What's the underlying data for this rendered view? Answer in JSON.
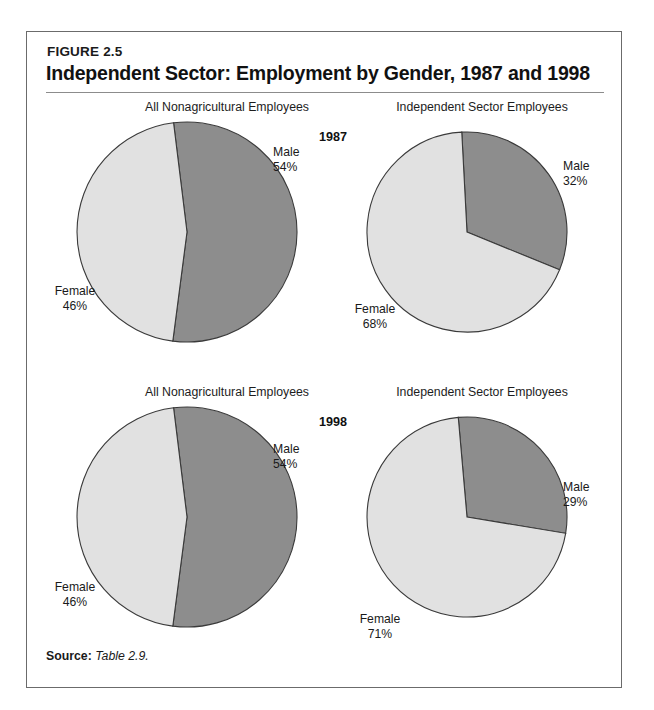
{
  "figure": {
    "number_label": "FIGURE 2.5",
    "title": "Independent Sector: Employment by Gender, 1987 and 1998",
    "source_key": "Source:",
    "source_value": "Table 2.9."
  },
  "column_headers": {
    "left": "All Nonagricultural Employees",
    "right": "Independent Sector Employees"
  },
  "year_labels": {
    "row1": "1987",
    "row2": "1998"
  },
  "labels": {
    "male": "Male",
    "female": "Female",
    "p54": "54%",
    "p46": "46%",
    "p32": "32%",
    "p68": "68%",
    "p29": "29%",
    "p71": "71%"
  },
  "colors": {
    "male_slice": "#8d8d8d",
    "female_slice": "#e1e1e1",
    "slice_outline": "#3a3a3a",
    "frame": "#6b6b6b",
    "text": "#1a1a1a"
  },
  "chart_data": [
    {
      "type": "pie",
      "title": "All Nonagricultural Employees",
      "year": "1987",
      "categories": [
        "Male",
        "Female"
      ],
      "values": [
        54,
        46
      ],
      "labels": [
        "54%",
        "46%"
      ],
      "colors": [
        "#8d8d8d",
        "#e1e1e1"
      ],
      "legend": "none",
      "start_angle_deg": -7,
      "direction": "clockwise"
    },
    {
      "type": "pie",
      "title": "Independent Sector Employees",
      "year": "1987",
      "categories": [
        "Male",
        "Female"
      ],
      "values": [
        32,
        68
      ],
      "labels": [
        "32%",
        "68%"
      ],
      "colors": [
        "#8d8d8d",
        "#e1e1e1"
      ],
      "legend": "none",
      "start_angle_deg": -3,
      "direction": "clockwise"
    },
    {
      "type": "pie",
      "title": "All Nonagricultural Employees",
      "year": "1998",
      "categories": [
        "Male",
        "Female"
      ],
      "values": [
        54,
        46
      ],
      "labels": [
        "54%",
        "46%"
      ],
      "colors": [
        "#8d8d8d",
        "#e1e1e1"
      ],
      "legend": "none",
      "start_angle_deg": -7,
      "direction": "clockwise"
    },
    {
      "type": "pie",
      "title": "Independent Sector Employees",
      "year": "1998",
      "categories": [
        "Male",
        "Female"
      ],
      "values": [
        29,
        71
      ],
      "labels": [
        "29%",
        "71%"
      ],
      "colors": [
        "#8d8d8d",
        "#e1e1e1"
      ],
      "legend": "none",
      "start_angle_deg": -5,
      "direction": "clockwise"
    }
  ]
}
